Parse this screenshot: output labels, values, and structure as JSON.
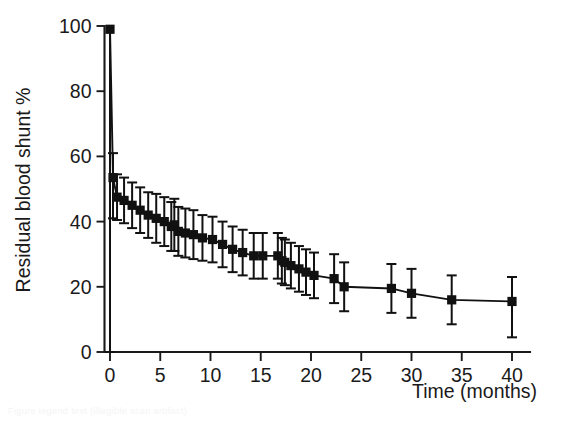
{
  "figure": {
    "background_color": "#ffffff",
    "ink_color": "#111111",
    "faint_caption": "Figure legend text (illegible scan artifact)"
  },
  "chart_data": {
    "type": "line",
    "title": "",
    "subtitle": "",
    "xlabel": "Time (months)",
    "ylabel": "Residual blood shunt %",
    "xlim": [
      -1.5,
      42
    ],
    "ylim": [
      0,
      100
    ],
    "xticks": [
      0,
      5,
      10,
      15,
      20,
      25,
      30,
      35,
      40
    ],
    "xtick_labels": [
      "0",
      "5",
      "10",
      "15",
      "20",
      "25",
      "30",
      "35",
      "40"
    ],
    "yticks": [
      0,
      20,
      40,
      60,
      80,
      100
    ],
    "ytick_labels": [
      "0",
      "20",
      "40",
      "60",
      "80",
      "100"
    ],
    "grid": false,
    "legend": null,
    "legend_position": "none",
    "marker": "square",
    "error_bars": "vertical",
    "series": [
      {
        "name": "Residual blood shunt",
        "x": [
          0.0,
          0.3,
          0.7,
          1.4,
          2.2,
          3.0,
          3.8,
          4.6,
          5.4,
          6.1,
          6.4,
          6.8,
          7.5,
          8.3,
          9.2,
          10.2,
          11.2,
          12.2,
          13.2,
          14.3,
          15.2,
          16.7,
          17.1,
          17.4,
          18.0,
          18.8,
          19.5,
          20.3,
          22.3,
          23.3,
          28.0,
          30.0,
          34.0,
          40.0
        ],
        "y": [
          99.0,
          53.5,
          47.5,
          46.5,
          45.0,
          43.5,
          42.0,
          41.0,
          40.0,
          38.5,
          39.0,
          37.0,
          36.5,
          36.0,
          35.0,
          34.5,
          33.0,
          31.5,
          30.5,
          29.5,
          29.5,
          29.5,
          28.0,
          27.5,
          26.5,
          25.5,
          24.5,
          23.5,
          22.5,
          20.0,
          19.5,
          18.0,
          16.0,
          15.5
        ],
        "yerr_lower": [
          99.0,
          12.5,
          7.0,
          7.0,
          7.0,
          7.0,
          7.0,
          7.5,
          7.5,
          7.5,
          8.0,
          7.5,
          7.5,
          7.5,
          7.0,
          7.0,
          7.0,
          7.0,
          7.0,
          7.0,
          7.0,
          7.0,
          7.0,
          7.0,
          7.0,
          7.0,
          7.0,
          7.0,
          7.5,
          7.5,
          7.5,
          7.5,
          7.5,
          11.0
        ],
        "yerr_upper": [
          0.0,
          7.5,
          7.0,
          7.0,
          7.0,
          7.0,
          7.0,
          7.5,
          7.5,
          7.5,
          8.0,
          7.5,
          7.5,
          7.5,
          7.0,
          7.0,
          7.0,
          7.0,
          7.0,
          7.0,
          7.0,
          7.0,
          7.0,
          7.0,
          7.0,
          7.0,
          7.0,
          7.0,
          7.5,
          7.5,
          7.5,
          7.5,
          7.5,
          7.5
        ]
      }
    ]
  }
}
